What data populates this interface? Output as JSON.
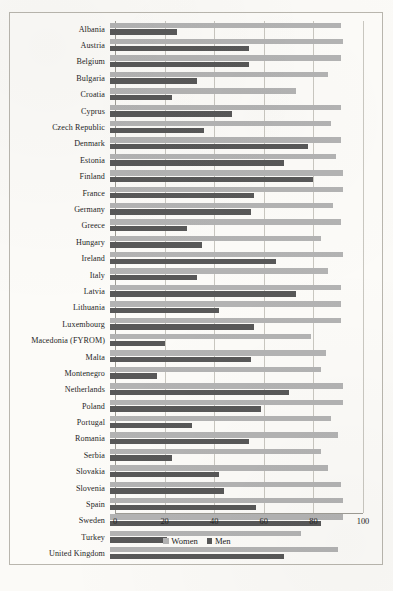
{
  "chart_data": {
    "type": "bar",
    "orientation": "horizontal",
    "title": "",
    "subtitle": "",
    "xlabel": "",
    "ylabel": "",
    "xlim": [
      0,
      100
    ],
    "xticks": [
      "0",
      "20",
      "40",
      "60",
      "80",
      "100"
    ],
    "xtick_values": [
      0,
      20,
      40,
      60,
      80,
      100
    ],
    "grid": "vertical",
    "legend_position": "bottom-center",
    "colors": {
      "women": "#b3b3b3",
      "men": "#585858",
      "gridline": "#c9c7c0",
      "axis": "#9e9c95",
      "background": "#fcfbf8",
      "text": "#262626"
    },
    "categories": [
      "Albania",
      "Austria",
      "Belgium",
      "Bulgaria",
      "Croatia",
      "Cyprus",
      "Czech Republic",
      "Denmark",
      "Estonia",
      "Finland",
      "France",
      "Germany",
      "Greece",
      "Hungary",
      "Ireland",
      "Italy",
      "Latvia",
      "Lithuania",
      "Luxembourg",
      "Macedonia (FYROM)",
      "Malta",
      "Montenegro",
      "Netherlands",
      "Poland",
      "Portugal",
      "Romania",
      "Serbia",
      "Slovakia",
      "Slovenia",
      "Spain",
      "Sweden",
      "Turkey",
      "United Kingdom"
    ],
    "series": [
      {
        "name": "Women",
        "color": "#b3b3b3",
        "values": [
          93,
          94,
          93,
          88,
          75,
          93,
          89,
          93,
          91,
          94,
          94,
          90,
          93,
          85,
          94,
          88,
          93,
          93,
          93,
          81,
          87,
          85,
          94,
          94,
          89,
          92,
          85,
          88,
          93,
          94,
          94,
          77,
          92
        ]
      },
      {
        "name": "Men",
        "color": "#585858",
        "values": [
          27,
          56,
          56,
          35,
          25,
          49,
          38,
          80,
          70,
          82,
          58,
          57,
          31,
          37,
          67,
          35,
          75,
          44,
          58,
          22,
          57,
          19,
          72,
          61,
          33,
          56,
          25,
          44,
          46,
          59,
          85,
          23,
          70
        ]
      }
    ]
  },
  "legend": {
    "women_label": "Women",
    "men_label": "Men"
  }
}
